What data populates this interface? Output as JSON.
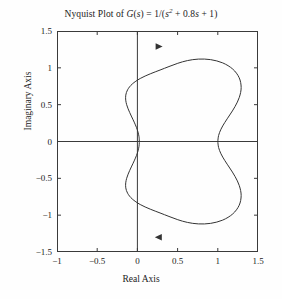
{
  "chart_data": {
    "type": "line",
    "title_parts": {
      "prefix": "Nyquist Plot of ",
      "g": "G",
      "paren_s_open": "(",
      "s1": "s",
      "paren_s_close": ")",
      "eq": " = 1/(",
      "s2": "s",
      "exp": "2",
      "mid": " + 0.8",
      "s3": "s",
      "tail": " + 1)"
    },
    "xlabel": "Real Axis",
    "ylabel": "Imaginary Axis",
    "xlim": [
      -1,
      1.5
    ],
    "ylim": [
      -1.5,
      1.5
    ],
    "xticks": [
      -1,
      -0.5,
      0,
      0.5,
      1,
      1.5
    ],
    "xtick_labels": [
      "-1",
      "-0.5",
      "0",
      "0.5",
      "1",
      "1.5"
    ],
    "yticks": [
      1.5,
      1,
      0.5,
      0,
      -0.5,
      -1,
      -1.5
    ],
    "ytick_labels": [
      "1.5",
      "1",
      "0.5",
      "0",
      "-0.5",
      "-1",
      "-1.5"
    ],
    "grid": false,
    "legend": null,
    "axis_lines": {
      "real_axis_y": 0,
      "imag_axis_x": 0
    },
    "annotations": [
      {
        "name": "direction-arrow-upper",
        "x": 0.27,
        "y": 1.29,
        "direction": "right"
      },
      {
        "name": "direction-arrow-lower",
        "x": 0.26,
        "y": -1.3,
        "direction": "left"
      }
    ],
    "series": [
      {
        "name": "G(jw)",
        "comment": "Nyquist contour of 1/(s^2+0.8s+1); closed curve through (1,0) at w=0 and (0,0) as w->inf",
        "points": [
          [
            1.0,
            0.0
          ],
          [
            1.0099,
            -0.0818
          ],
          [
            1.0395,
            -0.1668
          ],
          [
            1.0872,
            -0.2584
          ],
          [
            1.1484,
            -0.3598
          ],
          [
            1.2137,
            -0.4733
          ],
          [
            1.2675,
            -0.5991
          ],
          [
            1.2905,
            -0.7334
          ],
          [
            1.2656,
            -0.8665
          ],
          [
            1.1862,
            -0.9828
          ],
          [
            1.0608,
            -1.0671
          ],
          [
            0.9106,
            -1.1113
          ],
          [
            0.7588,
            -1.1185
          ],
          [
            0.6216,
            -1.0982
          ],
          [
            0.5023,
            -1.0615
          ],
          [
            0.3926,
            -1.0173
          ],
          [
            0.2819,
            -0.97
          ],
          [
            0.16,
            -0.9185
          ],
          [
            0.0351,
            -0.8556
          ],
          [
            -0.0642,
            -0.7802
          ],
          [
            -0.1217,
            -0.7026
          ],
          [
            -0.1445,
            -0.6289
          ],
          [
            -0.1451,
            -0.5611
          ],
          [
            -0.1334,
            -0.4995
          ],
          [
            -0.1155,
            -0.4434
          ],
          [
            -0.0955,
            -0.3923
          ],
          [
            -0.0756,
            -0.3455
          ],
          [
            -0.0569,
            -0.3025
          ],
          [
            -0.0399,
            -0.2628
          ],
          [
            -0.0249,
            -0.2258
          ],
          [
            -0.012,
            -0.1913
          ],
          [
            -0.0013,
            -0.1589
          ],
          [
            0.0074,
            -0.1283
          ],
          [
            0.0141,
            -0.0992
          ],
          [
            0.019,
            -0.0715
          ],
          [
            0.0222,
            -0.0447
          ],
          [
            0.0236,
            -0.0189
          ],
          [
            0.0236,
            0.0
          ],
          [
            0.0222,
            0.0447
          ],
          [
            0.019,
            0.0715
          ],
          [
            0.0141,
            0.0992
          ],
          [
            0.0074,
            0.1283
          ],
          [
            -0.0013,
            0.1589
          ],
          [
            -0.012,
            0.1913
          ],
          [
            -0.0249,
            0.2258
          ],
          [
            -0.0399,
            0.2628
          ],
          [
            -0.0569,
            0.3025
          ],
          [
            -0.0756,
            0.3455
          ],
          [
            -0.0955,
            0.3923
          ],
          [
            -0.1155,
            0.4434
          ],
          [
            -0.1334,
            0.4995
          ],
          [
            -0.1451,
            0.5611
          ],
          [
            -0.1445,
            0.6289
          ],
          [
            -0.1217,
            0.7026
          ],
          [
            -0.0642,
            0.7802
          ],
          [
            0.0351,
            0.8556
          ],
          [
            0.16,
            0.9185
          ],
          [
            0.2819,
            0.97
          ],
          [
            0.3926,
            1.0173
          ],
          [
            0.5023,
            1.0615
          ],
          [
            0.6216,
            1.0982
          ],
          [
            0.7588,
            1.1185
          ],
          [
            0.9106,
            1.1113
          ],
          [
            1.0608,
            1.0671
          ],
          [
            1.1862,
            0.9828
          ],
          [
            1.2656,
            0.8665
          ],
          [
            1.2905,
            0.7334
          ],
          [
            1.2675,
            0.5991
          ],
          [
            1.2137,
            0.4733
          ],
          [
            1.1484,
            0.3598
          ],
          [
            1.0872,
            0.2584
          ],
          [
            1.0395,
            0.1668
          ],
          [
            1.0099,
            0.0818
          ],
          [
            1.0,
            0.0
          ]
        ]
      }
    ],
    "colors": {
      "curve": "#333333",
      "axis": "#3a3a3a",
      "text": "#1a1a1a",
      "background": "#fefefe"
    }
  }
}
